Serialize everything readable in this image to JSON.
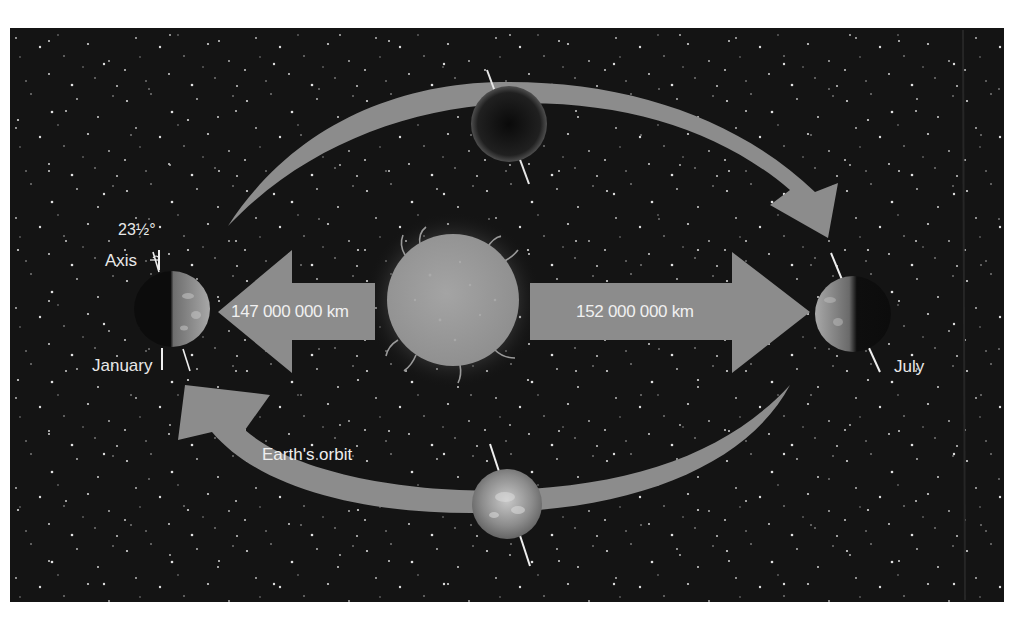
{
  "diagram": {
    "colors": {
      "page_background": "#ffffff",
      "space_background": "#141414",
      "arrow_fill": "#8a8a8a",
      "sun_fill": "#9a9a9a",
      "label_text": "#e8e8e8"
    },
    "labels": {
      "tilt_angle": "23½°",
      "axis": "Axis",
      "january": "January",
      "july": "July",
      "orbit": "Earth's orbit",
      "perihelion_distance": "147 000 000 km",
      "aphelion_distance": "152 000 000 km"
    },
    "bodies": [
      {
        "name": "Sun",
        "position": "center"
      },
      {
        "name": "Earth",
        "position": "left",
        "month": "January"
      },
      {
        "name": "Earth",
        "position": "right",
        "month": "July"
      },
      {
        "name": "Earth",
        "position": "top"
      },
      {
        "name": "Earth",
        "position": "bottom"
      }
    ],
    "arrows": [
      {
        "id": "perihelion-arrow",
        "direction": "left",
        "label_ref": "perihelion_distance"
      },
      {
        "id": "aphelion-arrow",
        "direction": "right",
        "label_ref": "aphelion_distance"
      },
      {
        "id": "orbit-arc-top",
        "direction": "clockwise to right"
      },
      {
        "id": "orbit-arc-bottom",
        "direction": "clockwise to left"
      }
    ]
  }
}
